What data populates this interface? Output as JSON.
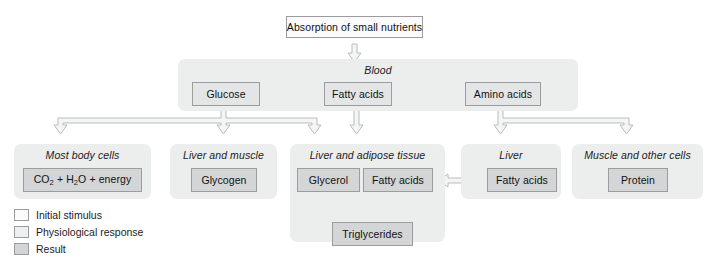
{
  "diagram": {
    "title": "Absorption of small nutrients",
    "top_node": {
      "label": "Absorption of small nutrients",
      "type": "stimulus"
    },
    "panels": [
      {
        "id": "blood",
        "title": "Blood"
      },
      {
        "id": "most-body-cells",
        "title": "Most body cells"
      },
      {
        "id": "liver-and-muscle",
        "title": "Liver and muscle"
      },
      {
        "id": "liver-adipose",
        "title": "Liver and adipose tissue"
      },
      {
        "id": "liver",
        "title": "Liver"
      },
      {
        "id": "muscle-other",
        "title": "Muscle and other cells"
      }
    ],
    "nodes": {
      "glucose": {
        "label": "Glucose",
        "type": "response"
      },
      "fatty_acids_blood": {
        "label": "Fatty acids",
        "type": "response"
      },
      "amino_acids": {
        "label": "Amino acids",
        "type": "response"
      },
      "co2": {
        "label": "CO2 + H2O + energy",
        "type": "result"
      },
      "glycogen": {
        "label": "Glycogen",
        "type": "result"
      },
      "glycerol": {
        "label": "Glycerol",
        "type": "result"
      },
      "fatty_acids_adipose": {
        "label": "Fatty acids",
        "type": "result"
      },
      "triglycerides": {
        "label": "Triglycerides",
        "type": "result"
      },
      "fatty_acids_liver": {
        "label": "Fatty acids",
        "type": "result"
      },
      "protein": {
        "label": "Protein",
        "type": "result"
      }
    },
    "legend": [
      {
        "key": "stimulus",
        "label": "Initial stimulus"
      },
      {
        "key": "response",
        "label": "Physiological response"
      },
      {
        "key": "result",
        "label": "Result"
      }
    ],
    "colors": {
      "panel_fill": "#eceded",
      "stimulus_fill": "#fbfbfb",
      "response_fill": "#e4e5e6",
      "result_fill": "#d3d5d6",
      "box_stroke": "#9a9c9e",
      "arrow_stroke": "#b9bbbd",
      "arrow_fill": "#f4f5f5",
      "text": "#1b1b1b"
    }
  }
}
